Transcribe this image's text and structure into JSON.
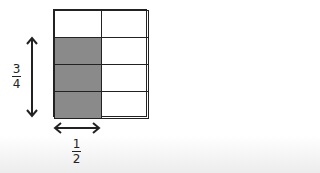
{
  "diagram": {
    "title": "",
    "grid": {
      "rows": 4,
      "cols": 2,
      "shaded_cells": [
        [
          1,
          0
        ],
        [
          2,
          0
        ],
        [
          3,
          0
        ]
      ],
      "shade_color": "#8a8a8a",
      "line_color": "#222222"
    },
    "vertical_label": {
      "numerator": "3",
      "denominator": "4"
    },
    "horizontal_label": {
      "numerator": "1",
      "denominator": "2"
    },
    "arrows": [
      "vertical-double-arrow",
      "horizontal-double-arrow"
    ]
  }
}
